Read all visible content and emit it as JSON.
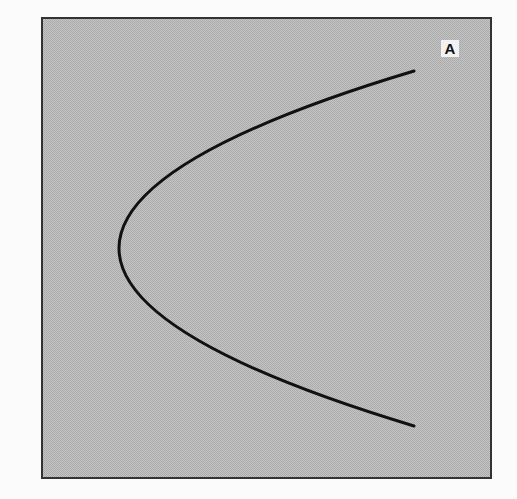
{
  "diagram": {
    "panel_label": "A",
    "background_color": "#b9b9b9",
    "frame_color": "#333333",
    "curve_color": "#111111",
    "curve": {
      "type": "sideways-parabola-opening-right",
      "start": [
        414,
        71
      ],
      "vertex": [
        119,
        248
      ],
      "end": [
        414,
        426
      ]
    }
  }
}
